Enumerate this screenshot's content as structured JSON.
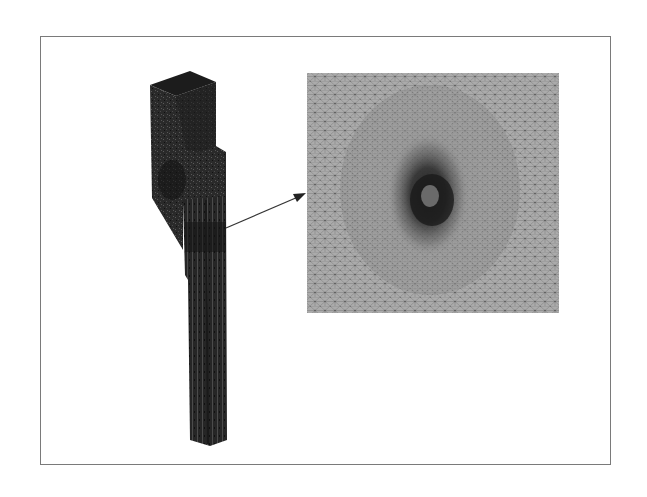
{
  "figure": {
    "colors": {
      "background": "#ffffff",
      "frame_border": "#7a7a7a",
      "part_fill": "#2b2b2b",
      "part_dark": "#1a1a1a",
      "mesh_bg": "#a9a9a9",
      "mesh_line": "#6e6e6e",
      "mesh_dense": "#3a3a3a",
      "arrow": "#333333"
    },
    "part_model": {
      "label": ""
    },
    "zoom_inset": {
      "label": ""
    },
    "callout_arrow": {
      "label": ""
    }
  }
}
